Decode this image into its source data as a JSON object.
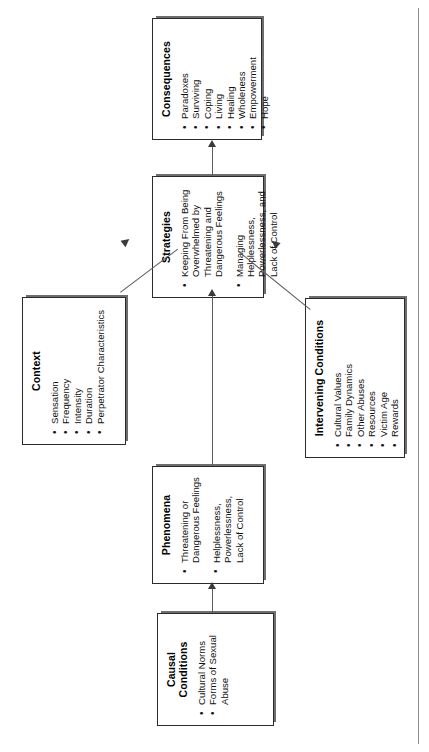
{
  "diagram": {
    "orientation": "rotated-90-ccw",
    "boxes": [
      {
        "id": "consequences",
        "title": "Consequences",
        "items": [
          "Paradoxes",
          "Surviving",
          "Coping",
          "Living",
          "Healing",
          "Wholeness",
          "Empowerment",
          "Hope"
        ]
      },
      {
        "id": "strategies",
        "title": "Strategies",
        "items": [
          "Keeping From Being Overwhelmed by Threatening and Dangerous Feelings",
          "Managing Helplessness, Powerlessness, and Lack of Control"
        ]
      },
      {
        "id": "context",
        "title": "Context",
        "items": [
          "Sensation",
          "Frequency",
          "Intensity",
          "Duration",
          "Perpetrator Characteristics"
        ]
      },
      {
        "id": "intervening-conditions",
        "title": "Intervening Conditions",
        "items": [
          "Cultural Values",
          "Family Dynamics",
          "Other Abuses",
          "Resources",
          "Victim Age",
          "Rewards"
        ]
      },
      {
        "id": "phenomena",
        "title": "Phenomena",
        "items": [
          "Threatening or Dangerous Feelings",
          "Helplessness, Powerlessness, Lack of Control"
        ]
      },
      {
        "id": "causal-conditions",
        "title": "Causal Conditions",
        "items": [
          "Cultural Norms",
          "Forms of Sexual Abuse"
        ]
      }
    ],
    "colors": {
      "box_border": "#2b2b2b",
      "box_shadow": "#6e6e6e",
      "connector": "#5c5c5c",
      "arrow_head": "#3a3a3a",
      "background": "#ffffff"
    }
  }
}
